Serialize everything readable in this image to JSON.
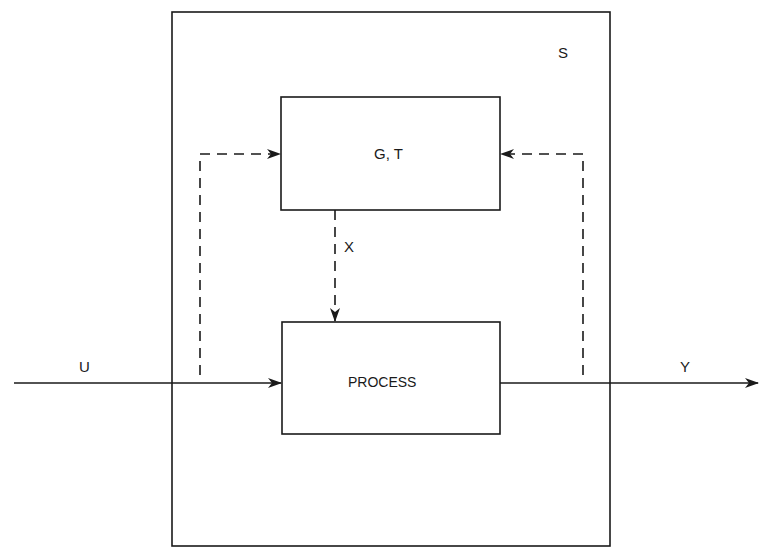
{
  "diagram": {
    "system_label": "S",
    "controller_block": {
      "label": "G, T"
    },
    "process_block": {
      "label": "PROCESS"
    },
    "signals": {
      "input": "U",
      "output": "Y",
      "control": "X"
    },
    "colors": {
      "line": "#1a1a1a",
      "background": "#ffffff"
    }
  }
}
